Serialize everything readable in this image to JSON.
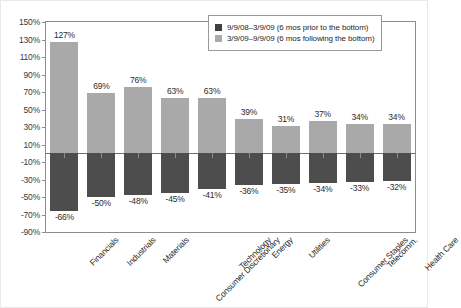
{
  "chart_data": {
    "type": "bar",
    "title": "",
    "subtitle": "",
    "xlabel": "",
    "ylabel": "",
    "ylim": [
      -90,
      150
    ],
    "ytick_step": 20,
    "grid": false,
    "zero_line": true,
    "legend_position": "top-right",
    "categories": [
      "Financials",
      "Industrials",
      "Materials",
      "Consumer Discretionary",
      "Technology",
      "Energy",
      "Utilities",
      "Consumer Staples",
      "Telecomm.",
      "Health Care"
    ],
    "ytick_labels": [
      "150%",
      "130%",
      "110%",
      "90%",
      "70%",
      "50%",
      "30%",
      "10%",
      "-10%",
      "-30%",
      "-50%",
      "-70%",
      "-90%"
    ],
    "ytick_values": [
      150,
      130,
      110,
      90,
      70,
      50,
      30,
      10,
      -10,
      -30,
      -50,
      -70,
      -90
    ],
    "series": [
      {
        "name": "9/9/08-3/9/09 (6 mos prior to the bottom)",
        "color": "#4d4d4d",
        "values": [
          -66,
          -50,
          -48,
          -45,
          -41,
          -36,
          -35,
          -34,
          -33,
          -32
        ],
        "labels": [
          "-66%",
          "-50%",
          "-48%",
          "-45%",
          "-41%",
          "-36%",
          "-35%",
          "-34%",
          "-33%",
          "-32%"
        ]
      },
      {
        "name": "3/9/09-9/9/09 (6 mos following the bottom)",
        "color": "#a9a9a9",
        "values": [
          127,
          69,
          76,
          63,
          63,
          39,
          31,
          37,
          34,
          34
        ],
        "labels": [
          "127%",
          "69%",
          "76%",
          "63%",
          "63%",
          "39%",
          "31%",
          "37%",
          "34%",
          "34%"
        ]
      }
    ]
  },
  "legend": {
    "items": [
      {
        "swatch": "dark",
        "label": "9/9/08–3/9/09 (6 mos prior to the bottom)"
      },
      {
        "swatch": "light",
        "label": "3/9/09–9/9/09 (6 mos following the bottom)"
      }
    ]
  }
}
